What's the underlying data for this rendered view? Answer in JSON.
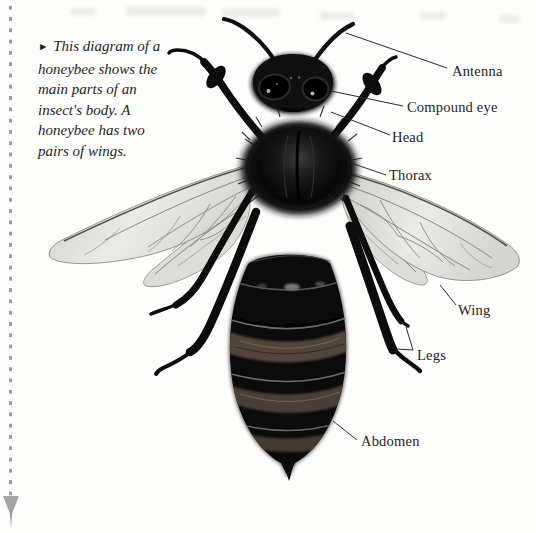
{
  "figure": {
    "caption_marker": "►",
    "caption_text": "This diagram of a honeybee shows the main parts of an insect's body. A honeybee has two pairs of wings.",
    "labels": {
      "antenna": "Antenna",
      "compound_eye": "Compound eye",
      "head": "Head",
      "thorax": "Thorax",
      "wing": "Wing",
      "legs": "Legs",
      "abdomen": "Abdomen"
    }
  },
  "colors": {
    "page_background": "#fdfdfb",
    "text": "#1f1f1f",
    "margin_dots": "#9c9c9c",
    "bee_body": "#0b0b0b",
    "abdomen_bands": "#55483a",
    "wing_fill": "#e2e1dc",
    "wing_vein": "#8a8a84"
  }
}
